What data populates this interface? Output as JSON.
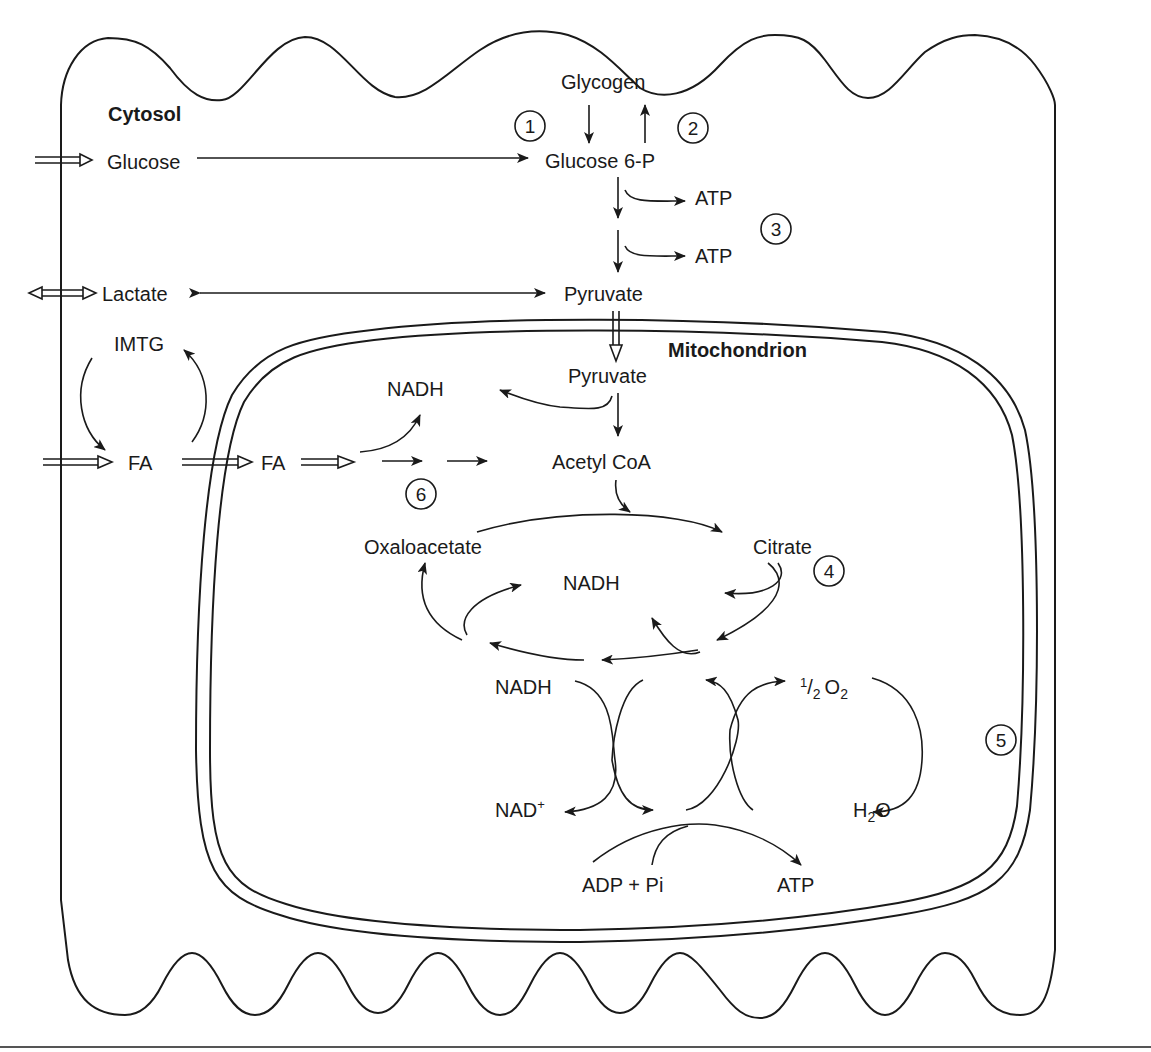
{
  "diagram": {
    "compartments": {
      "cytosol": "Cytosol",
      "mitochondrion": "Mitochondrion"
    },
    "cytosol_nodes": {
      "glycogen": "Glycogen",
      "glucose": "Glucose",
      "glucose6p": "Glucose 6-P",
      "atp_1": "ATP",
      "atp_2": "ATP",
      "lactate": "Lactate",
      "pyruvate": "Pyruvate",
      "imtg": "IMTG",
      "fa_outer": "FA",
      "fa_cytosol": "FA"
    },
    "mito_nodes": {
      "pyruvate": "Pyruvate",
      "nadh_top": "NADH",
      "acetyl_coa": "Acetyl CoA",
      "oxaloacetate": "Oxaloacetate",
      "citrate": "Citrate",
      "nadh_cycle": "NADH",
      "nadh_etc": "NADH",
      "nad_plus": "NAD",
      "nad_plus_sup": "+",
      "half": "1",
      "half_den": "2",
      "o2": "O",
      "o2_sub": "2",
      "h2o_h": "H",
      "h2o_sub": "2",
      "h2o_o": "O",
      "adp_pi": "ADP + Pi",
      "atp": "ATP"
    },
    "steps": [
      "1",
      "2",
      "3",
      "4",
      "5",
      "6"
    ]
  }
}
